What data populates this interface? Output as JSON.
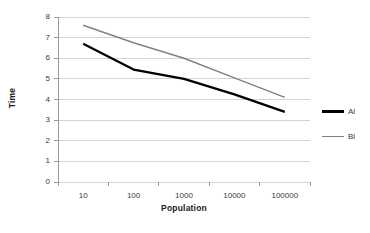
{
  "chart_data": {
    "type": "line",
    "title": "",
    "xlabel": "Population",
    "ylabel": "Time",
    "xscale": "log",
    "x": [
      10,
      100,
      1000,
      10000,
      100000
    ],
    "xtick_labels": [
      "10",
      "100",
      "1000",
      "10000",
      "100000"
    ],
    "ylim": [
      0,
      8
    ],
    "ytick_labels": [
      "0",
      "1",
      "2",
      "3",
      "4",
      "5",
      "6",
      "7",
      "8"
    ],
    "yticks": [
      0,
      1,
      2,
      3,
      4,
      5,
      6,
      7,
      8
    ],
    "grid": "horizontal",
    "legend_position": "right",
    "series": [
      {
        "name": "Al",
        "color": "#000000",
        "width": 2.2,
        "values": [
          6.7,
          5.45,
          5.0,
          4.25,
          3.4
        ]
      },
      {
        "name": "Bl",
        "color": "#808080",
        "width": 1.4,
        "values": [
          7.6,
          6.75,
          6.0,
          5.05,
          4.1
        ]
      }
    ]
  },
  "colors": {
    "background": "#ffffff",
    "gridline": "#d4d4d4",
    "axis": "#9a9a9a",
    "text": "#3a3a3a",
    "title_text": "#1a1a1a"
  }
}
